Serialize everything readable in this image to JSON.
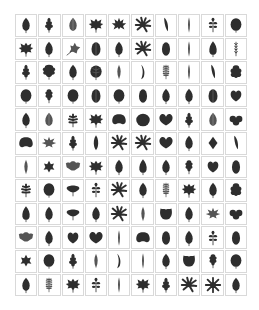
{
  "grid": {
    "columns": 10,
    "rows": 12
  },
  "colors": {
    "leaf": "#2e2e2e",
    "leaf_light": "#555555",
    "border": "#d9d9d9",
    "background": "#ffffff"
  },
  "rows": [
    [
      "ovate",
      "lobed-small",
      "ovate-light",
      "maple-wide",
      "maple-deep",
      "palmate-spiky",
      "lanceolate-tilt",
      "linear",
      "compound-small",
      "round"
    ],
    [
      "maple-wide",
      "ovate",
      "ivy-tilt",
      "oval-vein",
      "ovate",
      "palmate-spiky",
      "oval",
      "linear",
      "ovate-pointed",
      "fern-thin"
    ],
    [
      "lobed-small",
      "oak-round",
      "ovate",
      "round-vein",
      "lanceolate",
      "curved-linear",
      "fern",
      "linear",
      "lanceolate-tilt",
      "lobed-round"
    ],
    [
      "round",
      "oak-small",
      "round",
      "oval-vein",
      "round",
      "oval",
      "ovate",
      "ovate",
      "oval-vein",
      "heart-round"
    ],
    [
      "ovate",
      "ovate-light",
      "fern-lobed",
      "maple-wide",
      "kidney",
      "round-big",
      "heart-wide",
      "lobed-small",
      "ovate-light",
      "trifoliate"
    ],
    [
      "kidney",
      "maple-light",
      "lobed-small",
      "ovate-long",
      "palmate-spiky",
      "palmate-spiky",
      "heart-wide",
      "ovate",
      "rhombic",
      "lanceolate-tilt"
    ],
    [
      "lanceolate",
      "maple-small",
      "oak-wide",
      "maple-wide",
      "ovate",
      "ovate-pointed",
      "ovate",
      "oak-small",
      "heart-round",
      "oval"
    ],
    [
      "fern-lobed",
      "round",
      "fan",
      "compound-small",
      "palmate-spiky",
      "ovate",
      "fern",
      "maple-wide",
      "ovate",
      "lobed-round"
    ],
    [
      "ovate-pointed",
      "ovate",
      "fan",
      "ovate",
      "palmate-spiky",
      "lanceolate",
      "square-lobed",
      "ovate",
      "maple-light",
      "trifoliate"
    ],
    [
      "oak-wide",
      "ovate",
      "heart-round",
      "heart-wide",
      "linear",
      "kidney",
      "oval",
      "ovate",
      "compound-small",
      "oval"
    ],
    [
      "maple-small",
      "round",
      "lobed-small",
      "lanceolate",
      "curved-linear",
      "linear",
      "ovate",
      "square-lobed",
      "oak-small",
      "round"
    ],
    [
      "ovate",
      "fern",
      "maple-wide",
      "compound-small",
      "linear",
      "maple-wide",
      "lobed-small",
      "palmate-spiky",
      "star",
      "ovate"
    ]
  ]
}
